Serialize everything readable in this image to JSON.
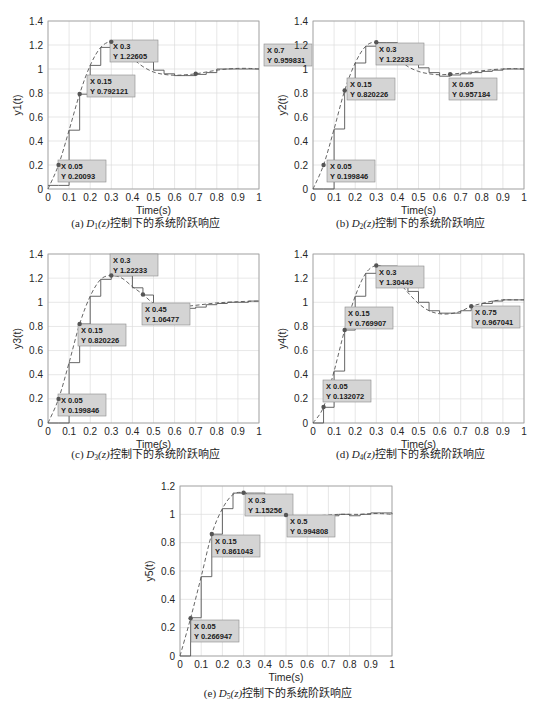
{
  "chart_data": [
    {
      "id": "a",
      "type": "line",
      "title": "",
      "caption": "(a) D1(z)控制下的系统阶跃响应",
      "caption_parts": {
        "prefix": "(a) ",
        "D": "D",
        "sub": "1",
        "z": "(z)",
        "suffix": "控制下的系统阶跃响应"
      },
      "xlabel": "Time(s)",
      "ylabel": "y1(t)",
      "xlim": [
        0,
        1
      ],
      "ylim": [
        0,
        1.4
      ],
      "xticks": [
        0,
        0.1,
        0.2,
        0.3,
        0.4,
        0.5,
        0.6,
        0.7,
        0.8,
        0.9,
        1
      ],
      "yticks": [
        0,
        0.2,
        0.4,
        0.6,
        0.8,
        1,
        1.2,
        1.4
      ],
      "grid": true,
      "series": [
        {
          "name": "continuous",
          "style": "dashed",
          "x": [
            0,
            0.05,
            0.1,
            0.15,
            0.2,
            0.25,
            0.3,
            0.35,
            0.4,
            0.45,
            0.5,
            0.55,
            0.6,
            0.65,
            0.7,
            0.75,
            0.8,
            0.85,
            0.9,
            0.95,
            1
          ],
          "y": [
            0,
            0.20093,
            0.49,
            0.792121,
            1.03,
            1.18,
            1.22605,
            1.17,
            1.09,
            1.02,
            0.975,
            0.955,
            0.948,
            0.952,
            0.959831,
            0.975,
            0.99,
            1.0,
            1.005,
            1.005,
            1.0
          ]
        },
        {
          "name": "discrete",
          "style": "stairs",
          "x": [
            0,
            0.05,
            0.1,
            0.15,
            0.2,
            0.25,
            0.3,
            0.35,
            0.4,
            0.45,
            0.5,
            0.55,
            0.6,
            0.65,
            0.7,
            0.75,
            0.8,
            0.85,
            0.9,
            0.95,
            1
          ],
          "y": [
            0.03,
            0.03,
            0.49,
            0.79,
            1.03,
            1.18,
            1.22,
            1.17,
            1.09,
            1.06,
            0.99,
            0.96,
            0.945,
            0.945,
            0.955,
            0.97,
            1.0,
            1.0,
            1.0,
            1.0,
            1.0
          ]
        }
      ],
      "datatips": [
        {
          "x": 0.05,
          "y": 0.20093,
          "xlabel": "X 0.05",
          "ylabel": "Y 0.20093"
        },
        {
          "x": 0.15,
          "y": 0.792121,
          "xlabel": "X 0.15",
          "ylabel": "Y 0.792121"
        },
        {
          "x": 0.3,
          "y": 1.22605,
          "xlabel": "X 0.3",
          "ylabel": "Y 1.22605"
        },
        {
          "x": 0.7,
          "y": 0.959831,
          "xlabel": "X 0.7",
          "ylabel": "Y 0.959831"
        }
      ]
    },
    {
      "id": "b",
      "type": "line",
      "title": "",
      "caption": "(b) D2(z)控制下的系统阶跃响应",
      "caption_parts": {
        "prefix": "(b) ",
        "D": "D",
        "sub": "2",
        "z": "(z)",
        "suffix": "控制下的系统阶跃响应"
      },
      "xlabel": "Time(s)",
      "ylabel": "y2(t)",
      "xlim": [
        0,
        1
      ],
      "ylim": [
        0,
        1.4
      ],
      "xticks": [
        0,
        0.1,
        0.2,
        0.3,
        0.4,
        0.5,
        0.6,
        0.7,
        0.8,
        0.9,
        1
      ],
      "yticks": [
        0,
        0.2,
        0.4,
        0.6,
        0.8,
        1,
        1.2,
        1.4
      ],
      "grid": true,
      "series": [
        {
          "name": "continuous",
          "style": "dashed",
          "x": [
            0,
            0.05,
            0.1,
            0.15,
            0.2,
            0.25,
            0.3,
            0.35,
            0.4,
            0.45,
            0.5,
            0.55,
            0.6,
            0.65,
            0.7,
            0.75,
            0.8,
            0.85,
            0.9,
            0.95,
            1
          ],
          "y": [
            0,
            0.199846,
            0.5,
            0.820226,
            1.05,
            1.19,
            1.22233,
            1.17,
            1.09,
            1.02,
            0.98,
            0.96,
            0.952,
            0.957184,
            0.965,
            0.975,
            0.985,
            0.995,
            1.0,
            1.003,
            1.0
          ]
        },
        {
          "name": "discrete",
          "style": "stairs",
          "x": [
            0,
            0.05,
            0.1,
            0.15,
            0.2,
            0.25,
            0.3,
            0.35,
            0.4,
            0.45,
            0.5,
            0.55,
            0.6,
            0.65,
            0.7,
            0.75,
            0.8,
            0.85,
            0.9,
            0.95,
            1
          ],
          "y": [
            0,
            0,
            0.5,
            0.82,
            1.05,
            1.19,
            1.22,
            1.22,
            1.07,
            1.07,
            1.01,
            0.97,
            0.94,
            0.95,
            0.96,
            0.97,
            0.98,
            0.99,
            1.0,
            1.0,
            1.0
          ]
        }
      ],
      "datatips": [
        {
          "x": 0.05,
          "y": 0.199846,
          "xlabel": "X 0.05",
          "ylabel": "Y 0.199846"
        },
        {
          "x": 0.15,
          "y": 0.820226,
          "xlabel": "X 0.15",
          "ylabel": "Y 0.820226"
        },
        {
          "x": 0.3,
          "y": 1.22233,
          "xlabel": "X 0.3",
          "ylabel": "Y 1.22233"
        },
        {
          "x": 0.65,
          "y": 0.957184,
          "xlabel": "X 0.65",
          "ylabel": "Y 0.957184"
        }
      ]
    },
    {
      "id": "c",
      "type": "line",
      "title": "",
      "caption": "(c) D3(z)控制下的系统阶跃响应",
      "caption_parts": {
        "prefix": "(c) ",
        "D": "D",
        "sub": "3",
        "z": "(z)",
        "suffix": "控制下的系统阶跃响应"
      },
      "xlabel": "Time(s)",
      "ylabel": "y3(t)",
      "xlim": [
        0,
        1
      ],
      "ylim": [
        0,
        1.4
      ],
      "xticks": [
        0,
        0.1,
        0.2,
        0.3,
        0.4,
        0.5,
        0.6,
        0.7,
        0.8,
        0.9,
        1
      ],
      "yticks": [
        0,
        0.2,
        0.4,
        0.6,
        0.8,
        1,
        1.2,
        1.4
      ],
      "grid": true,
      "series": [
        {
          "name": "continuous",
          "style": "dashed",
          "x": [
            0,
            0.05,
            0.1,
            0.15,
            0.2,
            0.25,
            0.3,
            0.35,
            0.4,
            0.45,
            0.5,
            0.55,
            0.6,
            0.65,
            0.7,
            0.75,
            0.8,
            0.85,
            0.9,
            0.95,
            1
          ],
          "y": [
            0,
            0.199846,
            0.5,
            0.820226,
            1.05,
            1.19,
            1.22233,
            1.2,
            1.13,
            1.06477,
            0.99,
            0.955,
            0.955,
            0.965,
            0.975,
            0.985,
            0.995,
            1.0,
            1.005,
            1.008,
            1.01
          ]
        },
        {
          "name": "discrete",
          "style": "stairs",
          "x": [
            0,
            0.05,
            0.1,
            0.15,
            0.2,
            0.25,
            0.3,
            0.35,
            0.4,
            0.45,
            0.5,
            0.55,
            0.6,
            0.65,
            0.7,
            0.75,
            0.8,
            0.85,
            0.9,
            0.95,
            1
          ],
          "y": [
            0,
            0,
            0.5,
            0.82,
            1.05,
            1.19,
            1.22,
            1.22,
            1.12,
            1.06,
            0.97,
            0.95,
            0.95,
            0.95,
            0.96,
            0.98,
            0.99,
            1.0,
            1.0,
            1.01,
            1.01
          ]
        }
      ],
      "datatips": [
        {
          "x": 0.05,
          "y": 0.199846,
          "xlabel": "X 0.05",
          "ylabel": "Y 0.199846"
        },
        {
          "x": 0.15,
          "y": 0.820226,
          "xlabel": "X 0.15",
          "ylabel": "Y 0.820226"
        },
        {
          "x": 0.3,
          "y": 1.22233,
          "xlabel": "X 0.3",
          "ylabel": "Y 1.22233"
        },
        {
          "x": 0.45,
          "y": 1.06477,
          "xlabel": "X 0.45",
          "ylabel": "Y 1.06477"
        }
      ]
    },
    {
      "id": "d",
      "type": "line",
      "title": "",
      "caption": "(d) D4(z)控制下的系统阶跃响应",
      "caption_parts": {
        "prefix": "(d) ",
        "D": "D",
        "sub": "4",
        "z": "(z)",
        "suffix": "控制下的系统阶跃响应"
      },
      "xlabel": "Time(s)",
      "ylabel": "y4(t)",
      "xlim": [
        0,
        1
      ],
      "ylim": [
        0,
        1.4
      ],
      "xticks": [
        0,
        0.1,
        0.2,
        0.3,
        0.4,
        0.5,
        0.6,
        0.7,
        0.8,
        0.9,
        1
      ],
      "yticks": [
        0,
        0.2,
        0.4,
        0.6,
        0.8,
        1,
        1.2,
        1.4
      ],
      "grid": true,
      "series": [
        {
          "name": "continuous",
          "style": "dashed",
          "x": [
            0,
            0.05,
            0.1,
            0.15,
            0.2,
            0.25,
            0.3,
            0.35,
            0.4,
            0.45,
            0.5,
            0.55,
            0.6,
            0.65,
            0.7,
            0.75,
            0.8,
            0.85,
            0.9,
            0.95,
            1
          ],
          "y": [
            0,
            0.132072,
            0.43,
            0.769907,
            1.05,
            1.24,
            1.30449,
            1.27,
            1.18,
            1.08,
            0.99,
            0.93,
            0.905,
            0.905,
            0.925,
            0.967041,
            0.99,
            1.01,
            1.02,
            1.02,
            1.02
          ]
        },
        {
          "name": "discrete",
          "style": "stairs",
          "x": [
            0,
            0.05,
            0.1,
            0.15,
            0.2,
            0.25,
            0.3,
            0.35,
            0.4,
            0.45,
            0.5,
            0.55,
            0.6,
            0.65,
            0.7,
            0.75,
            0.8,
            0.85,
            0.9,
            0.95,
            1
          ],
          "y": [
            0,
            0.13,
            0.43,
            0.77,
            1.05,
            1.24,
            1.3,
            1.3,
            1.18,
            1.09,
            1.0,
            0.93,
            0.91,
            0.91,
            0.93,
            0.96,
            0.99,
            1.01,
            1.02,
            1.02,
            1.02
          ]
        }
      ],
      "datatips": [
        {
          "x": 0.05,
          "y": 0.132072,
          "xlabel": "X 0.05",
          "ylabel": "Y 0.132072"
        },
        {
          "x": 0.15,
          "y": 0.769907,
          "xlabel": "X 0.15",
          "ylabel": "Y 0.769907"
        },
        {
          "x": 0.3,
          "y": 1.30449,
          "xlabel": "X 0.3",
          "ylabel": "Y 1.30449"
        },
        {
          "x": 0.75,
          "y": 0.967041,
          "xlabel": "X 0.75",
          "ylabel": "Y 0.967041"
        }
      ]
    },
    {
      "id": "e",
      "type": "line",
      "title": "",
      "caption": "(e) D5(z)控制下的系统阶跃响应",
      "caption_parts": {
        "prefix": "(e) ",
        "D": "D",
        "sub": "5",
        "z": "(z)",
        "suffix": "控制下的系统阶跃响应"
      },
      "xlabel": "Time(s)",
      "ylabel": "y5(t)",
      "xlim": [
        0,
        1
      ],
      "ylim": [
        0,
        1.2
      ],
      "xticks": [
        0,
        0.1,
        0.2,
        0.3,
        0.4,
        0.5,
        0.6,
        0.7,
        0.8,
        0.9,
        1
      ],
      "yticks": [
        0,
        0.2,
        0.4,
        0.6,
        0.8,
        1,
        1.2
      ],
      "grid": true,
      "series": [
        {
          "name": "continuous",
          "style": "dashed",
          "x": [
            0,
            0.05,
            0.1,
            0.15,
            0.2,
            0.25,
            0.3,
            0.35,
            0.4,
            0.45,
            0.5,
            0.55,
            0.6,
            0.65,
            0.7,
            0.75,
            0.8,
            0.85,
            0.9,
            0.95,
            1
          ],
          "y": [
            0,
            0.266947,
            0.56,
            0.861043,
            1.04,
            1.14,
            1.15256,
            1.12,
            1.07,
            1.02,
            0.994808,
            0.985,
            0.985,
            0.99,
            0.995,
            1.0,
            1.0,
            1.0,
            1.005,
            1.005,
            1.0
          ]
        },
        {
          "name": "discrete",
          "style": "stairs",
          "x": [
            0,
            0.05,
            0.1,
            0.15,
            0.2,
            0.25,
            0.3,
            0.35,
            0.4,
            0.45,
            0.5,
            0.55,
            0.6,
            0.65,
            0.7,
            0.75,
            0.8,
            0.85,
            0.9,
            0.95,
            1
          ],
          "y": [
            0,
            0.27,
            0.56,
            0.86,
            1.04,
            1.15,
            1.15,
            1.15,
            1.05,
            1.05,
            0.99,
            0.99,
            0.99,
            0.97,
            0.99,
            1.0,
            0.99,
            1.0,
            1.01,
            1.01,
            1.0
          ]
        }
      ],
      "datatips": [
        {
          "x": 0.05,
          "y": 0.266947,
          "xlabel": "X 0.05",
          "ylabel": "Y 0.266947"
        },
        {
          "x": 0.15,
          "y": 0.861043,
          "xlabel": "X 0.15",
          "ylabel": "Y 0.861043"
        },
        {
          "x": 0.3,
          "y": 1.15256,
          "xlabel": "X 0.3",
          "ylabel": "Y 1.15256"
        },
        {
          "x": 0.5,
          "y": 0.994808,
          "xlabel": "X 0.5",
          "ylabel": "Y 0.994808"
        }
      ]
    }
  ],
  "colors": {
    "axis": "#262626",
    "grid": "#dcdcdc",
    "line": "#555555",
    "datatip_bg": "#d4d4d4",
    "datatip_border": "#8a8a8a",
    "marker": "#555555"
  }
}
